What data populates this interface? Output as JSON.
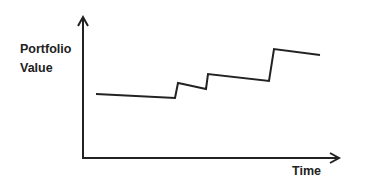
{
  "chart_data": {
    "type": "line",
    "title": "",
    "xlabel": "Time",
    "ylabel": "Portfolio\nValue",
    "grid": false,
    "legend": null,
    "axis_ticks": false,
    "series": [
      {
        "name": "Portfolio Value",
        "color": "#222222",
        "points_px": [
          [
            96,
            94
          ],
          [
            175,
            98
          ],
          [
            178,
            83
          ],
          [
            183,
            84
          ],
          [
            206,
            89
          ],
          [
            208,
            74
          ],
          [
            269,
            81
          ],
          [
            274,
            49
          ],
          [
            320,
            55
          ]
        ],
        "x": [
          0.0,
          0.32,
          0.33,
          0.35,
          0.44,
          0.45,
          0.7,
          0.72,
          0.9
        ],
        "values": [
          0.53,
          0.51,
          0.62,
          0.61,
          0.58,
          0.69,
          0.64,
          0.87,
          0.83
        ]
      }
    ],
    "annotations": []
  },
  "colors": {
    "line": "#222222",
    "axis": "#222222",
    "background": "#ffffff"
  }
}
